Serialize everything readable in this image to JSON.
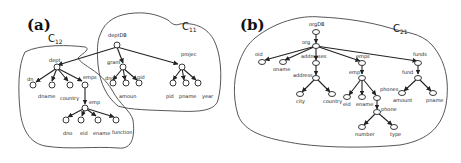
{
  "panels": [
    {
      "id": "a",
      "label": "(a)",
      "clusters": [
        {
          "name": "C",
          "sub": "12"
        },
        {
          "name": "C",
          "sub": "11"
        }
      ],
      "nodes": {
        "deptDB": "deptDB",
        "dept": "dept",
        "dn": "dn",
        "dname": "dname",
        "country": "country",
        "emps": "emps",
        "emp": "emp",
        "dno": "dno",
        "eid": "eid",
        "ename": "ename",
        "function": "function",
        "grant": "grant",
        "grant_dno": "dno",
        "amount": "amoun",
        "grant_pid": "pid",
        "project": "projec",
        "proj_pid": "pid",
        "pname": "pname",
        "year": "year"
      }
    },
    {
      "id": "b",
      "label": "(b)",
      "clusters": [
        {
          "name": "C",
          "sub": "21"
        }
      ],
      "nodes": {
        "orgDB": "orgDB",
        "org": "org",
        "oid": "oid",
        "oname": "oname",
        "addresses": "addresses",
        "address": "address",
        "city": "city",
        "country": "country",
        "emps": "emps",
        "emp": "emp",
        "eid": "eid",
        "ename": "ename",
        "phones": "phones",
        "phone": "phone",
        "number": "number",
        "type": "type",
        "funds": "funds",
        "fund": "fund",
        "amount": "amount",
        "pname": "pname"
      }
    }
  ]
}
